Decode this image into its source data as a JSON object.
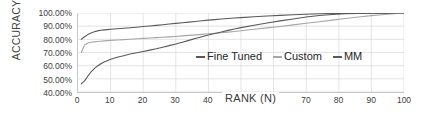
{
  "chart_data": {
    "type": "line",
    "title": "",
    "xlabel": "RANK (N)",
    "ylabel": "ACCURACY",
    "xlim": [
      0,
      100
    ],
    "ylim": [
      0.4,
      1.0
    ],
    "grid": true,
    "legend_position": "inside-center-right",
    "y_tick_labels": [
      "100.00%",
      "90.00%",
      "80.00%",
      "70.00%",
      "60.00%",
      "50.00%",
      "40.00%"
    ],
    "y_tick_values": [
      1.0,
      0.9,
      0.8,
      0.7,
      0.6,
      0.5,
      0.4
    ],
    "x_tick_labels": [
      "0",
      "10",
      "20",
      "30",
      "40",
      "50",
      "60",
      "70",
      "80",
      "90",
      "100"
    ],
    "x_tick_values": [
      0,
      10,
      20,
      30,
      40,
      50,
      60,
      70,
      80,
      90,
      100
    ],
    "x_ticks_hidden_by_axis_title": [
      50,
      60
    ],
    "x": [
      1,
      2,
      3,
      4,
      5,
      6,
      7,
      8,
      9,
      10,
      12,
      14,
      16,
      18,
      20,
      22,
      24,
      26,
      28,
      30,
      32,
      34,
      36,
      38,
      40,
      42,
      44,
      46,
      48,
      50,
      54,
      58,
      62,
      66,
      70,
      74,
      78,
      82,
      86,
      90,
      94,
      100
    ],
    "series": [
      {
        "name": "Fine Tuned",
        "color": "#595959",
        "values": [
          0.8,
          0.82,
          0.836,
          0.848,
          0.857,
          0.864,
          0.869,
          0.872,
          0.874,
          0.876,
          0.88,
          0.884,
          0.888,
          0.892,
          0.897,
          0.901,
          0.906,
          0.911,
          0.916,
          0.921,
          0.926,
          0.931,
          0.936,
          0.941,
          0.946,
          0.95,
          0.954,
          0.958,
          0.962,
          0.965,
          0.971,
          0.977,
          0.982,
          0.987,
          0.991,
          0.994,
          0.996,
          0.997,
          0.998,
          0.999,
          0.999,
          1.0
        ]
      },
      {
        "name": "Custom",
        "color": "#A6A6A6",
        "values": [
          0.7,
          0.757,
          0.772,
          0.778,
          0.781,
          0.784,
          0.786,
          0.788,
          0.79,
          0.792,
          0.795,
          0.798,
          0.801,
          0.804,
          0.807,
          0.81,
          0.813,
          0.816,
          0.819,
          0.822,
          0.826,
          0.83,
          0.834,
          0.838,
          0.842,
          0.846,
          0.85,
          0.855,
          0.86,
          0.865,
          0.876,
          0.887,
          0.898,
          0.91,
          0.922,
          0.934,
          0.946,
          0.958,
          0.97,
          0.98,
          0.989,
          1.0
        ]
      },
      {
        "name": "MM",
        "color": "#595959",
        "values": [
          0.462,
          0.485,
          0.52,
          0.552,
          0.578,
          0.598,
          0.614,
          0.627,
          0.638,
          0.648,
          0.664,
          0.676,
          0.688,
          0.698,
          0.708,
          0.718,
          0.728,
          0.74,
          0.752,
          0.765,
          0.778,
          0.792,
          0.806,
          0.82,
          0.833,
          0.845,
          0.856,
          0.868,
          0.879,
          0.889,
          0.907,
          0.924,
          0.94,
          0.955,
          0.97,
          0.981,
          0.989,
          0.994,
          0.997,
          0.998,
          0.999,
          1.0
        ]
      }
    ]
  },
  "legend": {
    "items": [
      {
        "label": "Fine Tuned",
        "color": "#595959"
      },
      {
        "label": "Custom",
        "color": "#A6A6A6"
      },
      {
        "label": "MM",
        "color": "#595959"
      }
    ]
  },
  "axes": {
    "x_title": "RANK (N)",
    "y_title": "ACCURACY"
  },
  "colors": {
    "grid": "#D9D9D9",
    "axis_line": "#C8C8C8",
    "text": "#404040",
    "plot_background": "#FFFFFF"
  }
}
